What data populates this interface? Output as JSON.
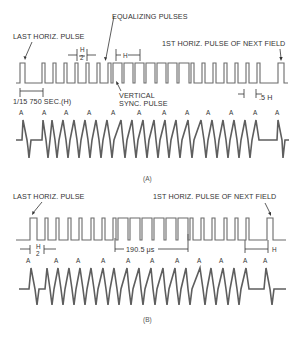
{
  "figure": {
    "panel_a": {
      "caption": "(A)",
      "labels": {
        "last_horiz_pulse": "LAST HORIZ. PULSE",
        "equalizing_pulses": "EQUALIZING PULSES",
        "first_horiz_pulse_next_field": "1ST HORIZ. PULSE OF NEXT FIELD",
        "vertical_sync_line1": "VERTICAL",
        "vertical_sync_line2": "SYNC. PULSE",
        "h_half_num": "H",
        "h_half_den": "2",
        "h_interval": "H",
        "line_period": "1/15 750 SEC.(H)",
        "half_h": ".5 H"
      },
      "differentiated_peak_label": "A",
      "peak_label_count": 12
    },
    "panel_b": {
      "caption": "(B)",
      "labels": {
        "last_horiz_pulse": "LAST HORIZ. PULSE",
        "first_horiz_pulse_next_field": "1ST HORIZ. PULSE OF NEXT FIELD",
        "h_half_num": "H",
        "h_half_den": "2",
        "serration_interval": "190.5 μs",
        "h_interval": "H"
      },
      "differentiated_peak_label": "A",
      "peak_label_count": 11
    },
    "colors": {
      "background": "#ffffff",
      "waveform": "#6b6b6b",
      "text": "#333333"
    }
  }
}
